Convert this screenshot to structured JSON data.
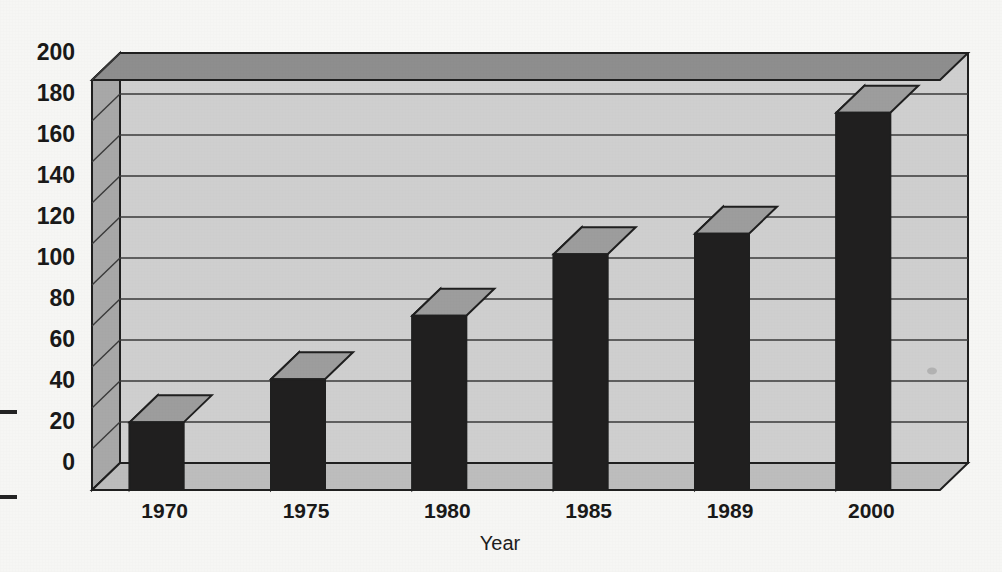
{
  "chart_data": {
    "type": "bar",
    "title": "",
    "subtitle": "",
    "xlabel": "Year",
    "ylabel": "",
    "categories": [
      "1970",
      "1975",
      "1980",
      "1985",
      "1989",
      "2000"
    ],
    "values": [
      33,
      54,
      85,
      115,
      125,
      184
    ],
    "ylim": [
      0,
      200
    ],
    "ytick_labels": [
      "0",
      "20",
      "40",
      "60",
      "80",
      "100",
      "120",
      "140",
      "160",
      "180",
      "200"
    ],
    "ytick_values": [
      0,
      20,
      40,
      60,
      80,
      100,
      120,
      140,
      160,
      180,
      200
    ],
    "grid": true,
    "legend": null,
    "style": "3d-column",
    "annotations": []
  },
  "colors": {
    "page_background": "#f6f6f4",
    "wall_back": "#cfcfcf",
    "wall_left": "#a8a8a8",
    "wall_top": "#8e8e8e",
    "floor": "#bdbdbd",
    "gridline": "#3a3a3a",
    "outline": "#1f1f1f",
    "bar_front": "#201f1f",
    "bar_side": "#bdbdbd",
    "bar_top": "#9d9d9d",
    "text": "#191919"
  },
  "marks": {
    "left_edge_tick_upper": "–",
    "left_edge_tick_lower": "–"
  }
}
